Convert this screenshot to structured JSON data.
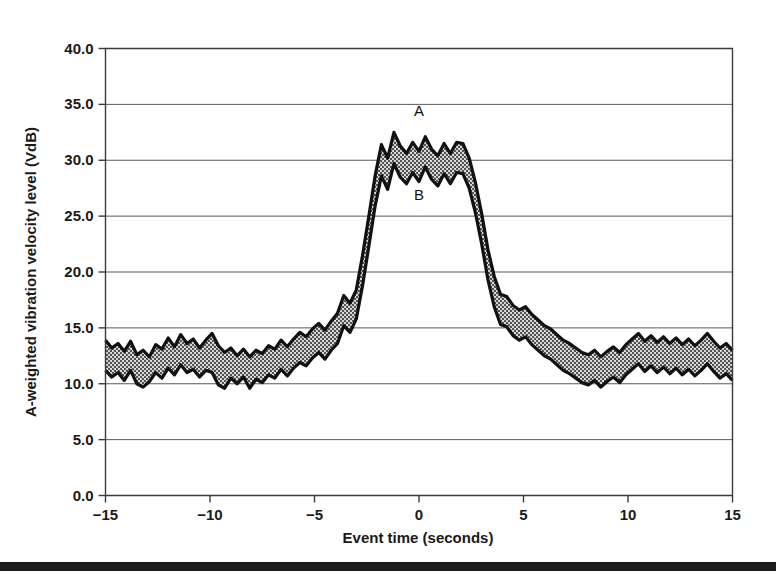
{
  "figure": {
    "background_color": "#ffffff",
    "footer_rule": {
      "name": "page-bottom-rule",
      "color": "#1b1b1b",
      "top": 562,
      "height": 9
    }
  },
  "chart_data": {
    "type": "area",
    "title": "",
    "xlabel": "Event time (seconds)",
    "ylabel": "A-weighted vibration velocity level (VdB)",
    "xlim": [
      -15,
      15
    ],
    "ylim": [
      0,
      40
    ],
    "xticks": [
      -15,
      -10,
      -5,
      0,
      5,
      10,
      15
    ],
    "xticklabels": [
      "−15",
      "−10",
      "−5",
      "0",
      "5",
      "10",
      "15"
    ],
    "yticks": [
      0,
      5,
      10,
      15,
      20,
      25,
      30,
      35,
      40
    ],
    "yticklabels": [
      "0.0",
      "5.0",
      "10.0",
      "15.0",
      "20.0",
      "25.0",
      "30.0",
      "35.0",
      "40.0"
    ],
    "grid": "horizontal",
    "grid_color": "#58595b",
    "legend_position": "inline-annotation",
    "annotations": [
      {
        "text": "A",
        "x": 0.0,
        "y": 34.0,
        "describes": "upper-bound-curve"
      },
      {
        "text": "B",
        "x": 0.0,
        "y": 26.4,
        "describes": "lower-bound-curve"
      }
    ],
    "fill_style": {
      "pattern": "stipple",
      "fill_color": "#6e6e6e",
      "outline_color": "#111111",
      "outline_width": 3.2
    },
    "series": [
      {
        "name": "A",
        "role": "upper bound",
        "x": [
          -15.0,
          -14.7,
          -14.4,
          -14.1,
          -13.8,
          -13.5,
          -13.2,
          -12.9,
          -12.6,
          -12.3,
          -12.0,
          -11.7,
          -11.4,
          -11.1,
          -10.8,
          -10.5,
          -10.2,
          -9.9,
          -9.6,
          -9.3,
          -9.0,
          -8.7,
          -8.4,
          -8.1,
          -7.8,
          -7.5,
          -7.2,
          -6.9,
          -6.6,
          -6.3,
          -6.0,
          -5.7,
          -5.4,
          -5.1,
          -4.8,
          -4.5,
          -4.2,
          -3.9,
          -3.6,
          -3.3,
          -3.0,
          -2.7,
          -2.4,
          -2.1,
          -1.8,
          -1.5,
          -1.2,
          -0.9,
          -0.6,
          -0.3,
          0.0,
          0.3,
          0.6,
          0.9,
          1.2,
          1.5,
          1.8,
          2.1,
          2.4,
          2.7,
          3.0,
          3.3,
          3.6,
          3.9,
          4.2,
          4.5,
          4.8,
          5.1,
          5.4,
          5.7,
          6.0,
          6.3,
          6.6,
          6.9,
          7.2,
          7.5,
          7.8,
          8.1,
          8.4,
          8.7,
          9.0,
          9.3,
          9.6,
          9.9,
          10.2,
          10.5,
          10.8,
          11.1,
          11.4,
          11.7,
          12.0,
          12.3,
          12.6,
          12.9,
          13.2,
          13.5,
          13.8,
          14.1,
          14.4,
          14.7,
          15.0
        ],
        "values": [
          13.9,
          13.2,
          13.6,
          12.9,
          13.8,
          12.6,
          13.0,
          12.4,
          13.5,
          13.1,
          14.1,
          13.3,
          14.4,
          13.6,
          14.0,
          13.2,
          13.9,
          14.5,
          13.4,
          12.8,
          13.2,
          12.5,
          13.1,
          12.4,
          13.0,
          12.7,
          13.4,
          13.1,
          13.9,
          13.3,
          14.0,
          14.6,
          14.2,
          14.9,
          15.4,
          14.8,
          15.6,
          16.3,
          17.9,
          17.2,
          18.4,
          21.5,
          25.0,
          28.6,
          31.4,
          30.2,
          32.5,
          31.3,
          30.6,
          31.6,
          30.8,
          32.1,
          31.0,
          30.4,
          31.5,
          30.6,
          31.6,
          31.5,
          30.2,
          28.0,
          25.2,
          22.0,
          19.6,
          18.0,
          17.8,
          17.0,
          16.6,
          16.9,
          16.2,
          15.7,
          15.2,
          14.9,
          14.4,
          13.9,
          13.6,
          13.2,
          12.8,
          12.6,
          13.0,
          12.4,
          12.9,
          13.3,
          12.8,
          13.5,
          14.0,
          14.5,
          13.8,
          14.3,
          13.7,
          14.2,
          13.6,
          14.1,
          13.5,
          14.0,
          13.4,
          13.9,
          14.5,
          13.8,
          13.2,
          13.6,
          13.0
        ]
      },
      {
        "name": "B",
        "role": "lower bound",
        "x": [
          -15.0,
          -14.7,
          -14.4,
          -14.1,
          -13.8,
          -13.5,
          -13.2,
          -12.9,
          -12.6,
          -12.3,
          -12.0,
          -11.7,
          -11.4,
          -11.1,
          -10.8,
          -10.5,
          -10.2,
          -9.9,
          -9.6,
          -9.3,
          -9.0,
          -8.7,
          -8.4,
          -8.1,
          -7.8,
          -7.5,
          -7.2,
          -6.9,
          -6.6,
          -6.3,
          -6.0,
          -5.7,
          -5.4,
          -5.1,
          -4.8,
          -4.5,
          -4.2,
          -3.9,
          -3.6,
          -3.3,
          -3.0,
          -2.7,
          -2.4,
          -2.1,
          -1.8,
          -1.5,
          -1.2,
          -0.9,
          -0.6,
          -0.3,
          0.0,
          0.3,
          0.6,
          0.9,
          1.2,
          1.5,
          1.8,
          2.1,
          2.4,
          2.7,
          3.0,
          3.3,
          3.6,
          3.9,
          4.2,
          4.5,
          4.8,
          5.1,
          5.4,
          5.7,
          6.0,
          6.3,
          6.6,
          6.9,
          7.2,
          7.5,
          7.8,
          8.1,
          8.4,
          8.7,
          9.0,
          9.3,
          9.6,
          9.9,
          10.2,
          10.5,
          10.8,
          11.1,
          11.4,
          11.7,
          12.0,
          12.3,
          12.6,
          12.9,
          13.2,
          13.5,
          13.8,
          14.1,
          14.4,
          14.7,
          15.0
        ],
        "values": [
          11.2,
          10.6,
          11.0,
          10.3,
          11.2,
          10.0,
          9.7,
          10.2,
          11.0,
          10.5,
          11.4,
          10.8,
          11.7,
          11.0,
          11.3,
          10.6,
          11.2,
          11.0,
          9.9,
          9.6,
          10.5,
          10.0,
          10.6,
          9.6,
          10.4,
          10.1,
          10.8,
          10.5,
          11.3,
          10.7,
          11.4,
          11.9,
          11.6,
          12.3,
          12.8,
          12.2,
          13.0,
          13.6,
          15.2,
          14.6,
          15.8,
          18.8,
          22.3,
          25.9,
          28.6,
          27.4,
          29.7,
          28.5,
          27.9,
          28.9,
          28.1,
          29.4,
          28.3,
          27.7,
          28.8,
          27.9,
          28.9,
          28.8,
          27.5,
          25.3,
          22.5,
          19.3,
          16.9,
          15.3,
          15.1,
          14.3,
          13.9,
          14.2,
          13.5,
          13.0,
          12.5,
          12.2,
          11.7,
          11.2,
          10.9,
          10.5,
          10.1,
          9.9,
          10.3,
          9.7,
          10.2,
          10.6,
          10.1,
          10.8,
          11.3,
          11.8,
          11.1,
          11.6,
          11.0,
          11.5,
          10.9,
          11.4,
          10.8,
          11.3,
          10.7,
          11.2,
          11.8,
          11.1,
          10.5,
          10.9,
          10.3
        ]
      }
    ]
  }
}
